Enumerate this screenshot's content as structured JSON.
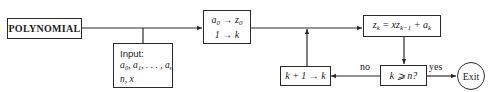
{
  "diagram": {
    "type": "flowchart",
    "nodes": {
      "start": {
        "label": "POLYNOMIAL"
      },
      "input": {
        "header": "Input:",
        "line1_parts": [
          "a",
          "0",
          ", a",
          "1",
          ", . . . , a",
          "n"
        ],
        "line2": "n, x"
      },
      "init": {
        "line1_parts": [
          "a",
          "0",
          " → z",
          "0"
        ],
        "line2": "1 → k"
      },
      "compute": {
        "parts": [
          "z",
          "k",
          " = xz",
          "k−1",
          " + a",
          "k"
        ]
      },
      "decision": {
        "label": "k ⩾ n?"
      },
      "increment": {
        "label": "k + 1 → k"
      },
      "exit": {
        "label": "Exit"
      }
    },
    "edges": {
      "no_label": "no",
      "yes_label": "yes"
    },
    "colors": {
      "stroke": "#2a2a2a",
      "text": "#222222",
      "background": "#ffffff"
    }
  }
}
